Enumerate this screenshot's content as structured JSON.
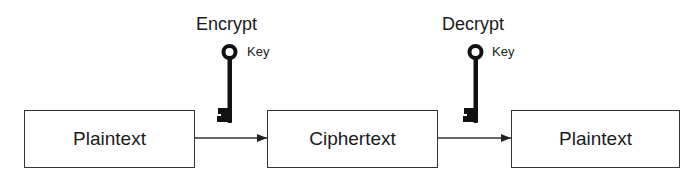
{
  "diagram": {
    "nodes": [
      {
        "id": "plaintext-in",
        "label": "Plaintext"
      },
      {
        "id": "ciphertext",
        "label": "Ciphertext"
      },
      {
        "id": "plaintext-out",
        "label": "Plaintext"
      }
    ],
    "edges": [
      {
        "from": "plaintext-in",
        "to": "ciphertext",
        "operation": "Encrypt",
        "key_label": "Key",
        "icon": "key-icon"
      },
      {
        "from": "ciphertext",
        "to": "plaintext-out",
        "operation": "Decrypt",
        "key_label": "Key",
        "icon": "key-icon"
      }
    ],
    "colors": {
      "stroke": "#333333",
      "key": "#111111",
      "text": "#1a1a1a",
      "background": "#ffffff"
    }
  }
}
